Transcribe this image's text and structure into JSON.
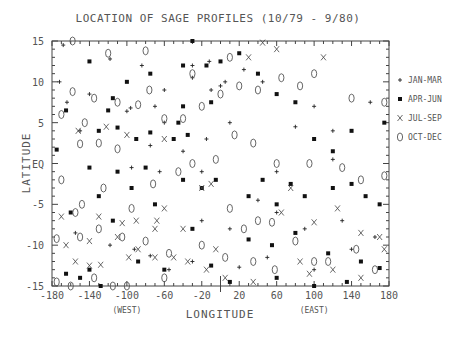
{
  "chart_data": {
    "type": "scatter",
    "title": "LOCATION OF SAGE PROFILES (10/79 - 9/80)",
    "xlabel": "LONGITUDE",
    "ylabel": "LATITUDE",
    "xlim": [
      -180,
      180
    ],
    "ylim": [
      -15,
      15
    ],
    "x_ticks": [
      -180,
      -140,
      -100,
      -60,
      -20,
      20,
      60,
      100,
      140,
      180
    ],
    "y_ticks": [
      {
        "v": 15,
        "label": "15"
      },
      {
        "v": 10,
        "label": "10"
      },
      {
        "v": 5,
        "label": "5"
      },
      {
        "v": 0,
        "label": "EQ"
      },
      {
        "v": -5,
        "label": "-5"
      },
      {
        "v": -10,
        "label": "-10"
      },
      {
        "v": -15,
        "label": "-15"
      }
    ],
    "x_annotations": [
      {
        "x": -100,
        "label": "(WEST)"
      },
      {
        "x": 100,
        "label": "(EAST)"
      }
    ],
    "grid": false,
    "legend_position": "right",
    "legend": [
      {
        "marker": "+",
        "label": "JAN-MAR"
      },
      {
        "marker": "■",
        "label": "APR-JUN"
      },
      {
        "marker": "X",
        "label": "JUL-SEP"
      },
      {
        "marker": "0",
        "label": "OCT-DEC"
      }
    ],
    "series": [
      {
        "name": "JAN-MAR",
        "marker": "+",
        "points": [
          [
            -168,
            14.5
          ],
          [
            -118,
            12.8
          ],
          [
            -84,
            12
          ],
          [
            -172,
            10
          ],
          [
            -96,
            6.8
          ],
          [
            -164,
            7.5
          ],
          [
            -100,
            6.4
          ],
          [
            -70,
            7
          ],
          [
            -140,
            8.5
          ],
          [
            -60,
            9
          ],
          [
            -30,
            12
          ],
          [
            -12,
            12.5
          ],
          [
            5,
            10
          ],
          [
            0,
            9.5
          ],
          [
            -10,
            9
          ],
          [
            -30,
            10.5
          ],
          [
            25,
            11.5
          ],
          [
            45,
            10
          ],
          [
            -150,
            4
          ],
          [
            -75,
            2.2
          ],
          [
            -40,
            1.5
          ],
          [
            -15,
            3
          ],
          [
            -60,
            5
          ],
          [
            10,
            5
          ],
          [
            80,
            4.5
          ],
          [
            100,
            7
          ],
          [
            120,
            4
          ],
          [
            160,
            7.5
          ],
          [
            -95,
            -0.5
          ],
          [
            -65,
            -1
          ],
          [
            -20,
            -1
          ],
          [
            60,
            -1
          ],
          [
            120,
            0.5
          ],
          [
            -155,
            -8.5
          ],
          [
            -118,
            -10
          ],
          [
            -92,
            -10.5
          ],
          [
            -75,
            -11.3
          ],
          [
            40,
            -4.5
          ],
          [
            60,
            -6
          ],
          [
            90,
            -8
          ],
          [
            130,
            -7
          ],
          [
            -30,
            -12
          ],
          [
            -55,
            -13
          ],
          [
            20,
            -12.7
          ],
          [
            50,
            -11.5
          ],
          [
            100,
            -13
          ],
          [
            140,
            -10.5
          ],
          [
            165,
            -9
          ],
          [
            -20,
            -7
          ],
          [
            10,
            -8
          ]
        ]
      },
      {
        "name": "APR-JUN",
        "marker": "■",
        "points": [
          [
            -140,
            12.5
          ],
          [
            -100,
            10
          ],
          [
            -75,
            11
          ],
          [
            -175,
            1.7
          ],
          [
            -120,
            6.5
          ],
          [
            -115,
            8
          ],
          [
            -50,
            3
          ],
          [
            -165,
            6.5
          ],
          [
            -130,
            4
          ],
          [
            -110,
            4.4
          ],
          [
            -90,
            3
          ],
          [
            -75,
            3.8
          ],
          [
            -45,
            5
          ],
          [
            0,
            12.5
          ],
          [
            20,
            13.5
          ],
          [
            -40,
            12
          ],
          [
            -30,
            15
          ],
          [
            -15,
            12
          ],
          [
            40,
            11
          ],
          [
            60,
            8.5
          ],
          [
            80,
            7.5
          ],
          [
            100,
            3
          ],
          [
            120,
            1.5
          ],
          [
            140,
            4
          ],
          [
            175,
            5
          ],
          [
            -40,
            7
          ],
          [
            -10,
            7.5
          ],
          [
            -35,
            3.5
          ],
          [
            -140,
            -0.5
          ],
          [
            -110,
            -1
          ],
          [
            -80,
            -0.5
          ],
          [
            -160,
            -6
          ],
          [
            -130,
            -4
          ],
          [
            -115,
            -7
          ],
          [
            -95,
            -3
          ],
          [
            -70,
            -5
          ],
          [
            -40,
            -2
          ],
          [
            -20,
            -3
          ],
          [
            -5,
            -2
          ],
          [
            30,
            -4
          ],
          [
            45,
            -2
          ],
          [
            60,
            -5
          ],
          [
            75,
            -2.5
          ],
          [
            90,
            -4
          ],
          [
            120,
            -3
          ],
          [
            140,
            -2.5
          ],
          [
            155,
            -4
          ],
          [
            170,
            -5
          ],
          [
            -165,
            -13.5
          ],
          [
            -150,
            -14
          ],
          [
            -128,
            -15
          ],
          [
            -140,
            -13
          ],
          [
            -88,
            -12
          ],
          [
            -60,
            -13
          ],
          [
            -30,
            -8
          ],
          [
            -10,
            -12.5
          ],
          [
            30,
            -9.3
          ],
          [
            55,
            -10
          ],
          [
            80,
            -8.5
          ],
          [
            115,
            -11
          ],
          [
            150,
            -12
          ],
          [
            170,
            -12.8
          ],
          [
            10,
            -14.5
          ],
          [
            60,
            -14
          ],
          [
            100,
            -15
          ],
          [
            135,
            -14.5
          ]
        ]
      },
      {
        "name": "JUL-SEP",
        "marker": "X",
        "points": [
          [
            -152,
            4
          ],
          [
            -122,
            4.5
          ],
          [
            -100,
            3.5
          ],
          [
            -60,
            3
          ],
          [
            -20,
            -3
          ],
          [
            -10,
            -2.5
          ],
          [
            65,
            -6
          ],
          [
            100,
            -7.2
          ],
          [
            125,
            -5.5
          ],
          [
            150,
            -8.5
          ],
          [
            175,
            -10.5
          ],
          [
            -170,
            -6.5
          ],
          [
            -130,
            -6.5
          ],
          [
            -105,
            -7.3
          ],
          [
            -90,
            -7
          ],
          [
            -68,
            -7
          ],
          [
            -155,
            -12
          ],
          [
            -140,
            -12.5
          ],
          [
            -128,
            -12.4
          ],
          [
            -98,
            -11.5
          ],
          [
            -88,
            -10.5
          ],
          [
            -70,
            -11.5
          ],
          [
            -165,
            -10
          ],
          [
            -110,
            -9
          ],
          [
            -140,
            -9.5
          ],
          [
            -50,
            -11.5
          ],
          [
            -35,
            -12
          ],
          [
            -15,
            -13
          ],
          [
            5,
            -14
          ],
          [
            35,
            -14.5
          ],
          [
            85,
            -12
          ],
          [
            95,
            -13.5
          ],
          [
            120,
            -13
          ],
          [
            150,
            -14
          ],
          [
            170,
            -9
          ],
          [
            30,
            13
          ],
          [
            45,
            14.8
          ],
          [
            60,
            14
          ],
          [
            -40,
            -8
          ],
          [
            -60,
            -5.5
          ],
          [
            -5,
            -10.5
          ],
          [
            75,
            -3
          ],
          [
            110,
            13
          ],
          [
            -70,
            -8
          ]
        ]
      },
      {
        "name": "OCT-DEC",
        "marker": "0",
        "points": [
          [
            -158,
            15
          ],
          [
            -120,
            13.5
          ],
          [
            -80,
            13.8
          ],
          [
            -158,
            8.8
          ],
          [
            -135,
            8
          ],
          [
            -110,
            7.5
          ],
          [
            -88,
            7.2
          ],
          [
            -76,
            9
          ],
          [
            -170,
            6
          ],
          [
            -145,
            5
          ],
          [
            -130,
            2.5
          ],
          [
            -110,
            1.8
          ],
          [
            -60,
            5.5
          ],
          [
            -40,
            5.5
          ],
          [
            -20,
            7
          ],
          [
            0,
            8.5
          ],
          [
            -30,
            11
          ],
          [
            10,
            13
          ],
          [
            20,
            9.5
          ],
          [
            40,
            9
          ],
          [
            65,
            10.5
          ],
          [
            85,
            9.5
          ],
          [
            100,
            11
          ],
          [
            140,
            8
          ],
          [
            175,
            7.5
          ],
          [
            -150,
            2.4
          ],
          [
            -170,
            -2
          ],
          [
            -148,
            -5
          ],
          [
            -125,
            -3
          ],
          [
            -95,
            -5.5
          ],
          [
            -72,
            -2.5
          ],
          [
            -45,
            -1
          ],
          [
            -30,
            0
          ],
          [
            -5,
            0.5
          ],
          [
            15,
            3.5
          ],
          [
            35,
            2.5
          ],
          [
            60,
            0
          ],
          [
            95,
            0
          ],
          [
            130,
            -0.5
          ],
          [
            150,
            -2
          ],
          [
            175,
            -1.5
          ],
          [
            -175,
            -9.2
          ],
          [
            -155,
            -6
          ],
          [
            -130,
            -8
          ],
          [
            -105,
            -9
          ],
          [
            -80,
            -9.5
          ],
          [
            -55,
            -11
          ],
          [
            -175,
            -14.5
          ],
          [
            -135,
            -14
          ],
          [
            -100,
            -15
          ],
          [
            -60,
            -14
          ],
          [
            -20,
            -10
          ],
          [
            5,
            -11.5
          ],
          [
            25,
            -8
          ],
          [
            40,
            -7
          ],
          [
            55,
            -7.2
          ],
          [
            80,
            -9.5
          ],
          [
            100,
            -12
          ],
          [
            115,
            -12
          ],
          [
            145,
            -10.5
          ],
          [
            165,
            -13
          ],
          [
            10,
            -5.5
          ],
          [
            35,
            -12
          ],
          [
            58,
            -13
          ],
          [
            -150,
            -9
          ],
          [
            -115,
            -15
          ],
          [
            -160,
            -15
          ]
        ]
      }
    ]
  }
}
